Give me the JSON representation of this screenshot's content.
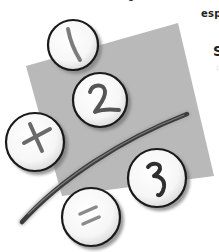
{
  "document": {
    "text_fragments": {
      "line1": "esp",
      "line2": "S",
      "line3": ":"
    }
  },
  "illustration": {
    "description": "math equation buttons",
    "backdrop_color": "#b8b8b8",
    "stroke_color": "#555555",
    "buttons": [
      {
        "id": "one",
        "symbol": "1"
      },
      {
        "id": "two",
        "symbol": "2"
      },
      {
        "id": "plus",
        "symbol": "+"
      },
      {
        "id": "three",
        "symbol": "3"
      },
      {
        "id": "equals",
        "symbol": "="
      }
    ]
  }
}
